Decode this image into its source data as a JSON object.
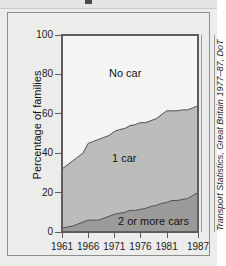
{
  "figure": {
    "source_caption": "Transport Statistics, Great Britain 1977–87, DoT"
  },
  "chart_data": {
    "type": "area",
    "stacked": true,
    "title": "",
    "xlabel": "",
    "ylabel": "Percentage of families",
    "xlim": [
      1961,
      1987
    ],
    "ylim": [
      0,
      100
    ],
    "grid": false,
    "legend_position": "inline-labels",
    "x_tick_labels": [
      "1961",
      "1966",
      "1971",
      "1976",
      "1981",
      "1987"
    ],
    "x_ticks": [
      1961,
      1966,
      1971,
      1976,
      1981,
      1987
    ],
    "y_tick_labels": [
      "0",
      "20",
      "40",
      "60",
      "80",
      "100"
    ],
    "y_ticks": [
      0,
      20,
      40,
      60,
      80,
      100
    ],
    "x": [
      1961,
      1962,
      1963,
      1964,
      1965,
      1966,
      1967,
      1968,
      1969,
      1970,
      1971,
      1972,
      1973,
      1974,
      1975,
      1976,
      1977,
      1978,
      1979,
      1980,
      1981,
      1982,
      1983,
      1984,
      1985,
      1986,
      1987
    ],
    "series": [
      {
        "name": "2 or more cars",
        "color": "#9a9a98",
        "values": [
          2,
          2.5,
          3,
          4,
          5,
          6,
          6,
          6,
          7,
          8,
          9,
          9.5,
          10,
          11,
          11,
          11.5,
          12,
          13,
          13.5,
          14.5,
          15,
          16,
          16,
          16.5,
          17,
          18.5,
          20
        ]
      },
      {
        "name": "1 car",
        "color": "#bcbcba",
        "values": [
          30,
          31.5,
          33,
          34,
          35,
          39,
          40,
          41,
          41,
          41,
          42,
          42.5,
          42.5,
          43,
          43.5,
          44,
          43.5,
          43.5,
          44,
          45,
          46.5,
          45.5,
          45.5,
          45.5,
          45,
          44.5,
          44
        ]
      },
      {
        "name": "No car",
        "color": "#f4f4f3",
        "values": [
          68,
          66,
          64,
          62,
          60,
          55,
          54,
          53,
          52,
          51,
          49,
          48,
          47.5,
          46,
          45.5,
          44.5,
          44.5,
          43.5,
          42.5,
          40.5,
          38.5,
          38.5,
          38.5,
          38,
          38,
          37,
          36
        ]
      }
    ],
    "cumulative_upper_bounds": {
      "two_or_more_cars": [
        2,
        2.5,
        3,
        4,
        5,
        6,
        6,
        6,
        7,
        8,
        9,
        9.5,
        10,
        11,
        11,
        11.5,
        12,
        13,
        13.5,
        14.5,
        15,
        16,
        16,
        16.5,
        17,
        18.5,
        20
      ],
      "one_car": [
        32,
        34,
        36,
        38,
        40,
        45,
        46,
        47,
        48,
        49,
        51,
        52,
        52.5,
        54,
        54.5,
        55.5,
        55.5,
        56.5,
        57.5,
        59.5,
        61.5,
        61.5,
        61.5,
        62,
        62,
        63,
        64
      ],
      "no_car": [
        100,
        100,
        100,
        100,
        100,
        100,
        100,
        100,
        100,
        100,
        100,
        100,
        100,
        100,
        100,
        100,
        100,
        100,
        100,
        100,
        100,
        100,
        100,
        100,
        100,
        100,
        100
      ]
    },
    "band_labels": [
      {
        "name": "No car",
        "text": "No car"
      },
      {
        "name": "1 car",
        "text": "1 car"
      },
      {
        "name": "2 or more cars",
        "text": "2 or more cars"
      }
    ]
  }
}
